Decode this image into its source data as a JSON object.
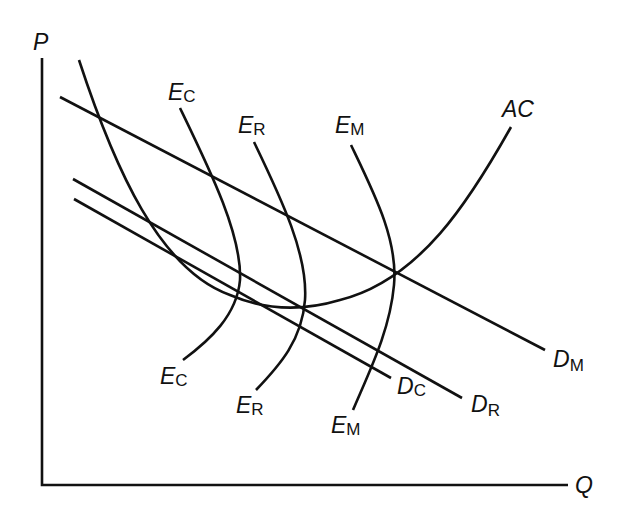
{
  "diagram": {
    "type": "economics-cost-demand-diagram",
    "axes": {
      "y_label": "P",
      "x_label": "Q"
    },
    "curves": {
      "average_cost": {
        "label": "AC"
      },
      "demand_monopoly": {
        "label_main": "D",
        "label_sub": "M"
      },
      "demand_cournot": {
        "label_main": "D",
        "label_sub": "C"
      },
      "demand_r": {
        "label_main": "D",
        "label_sub": "R"
      },
      "equilibrium_cournot": {
        "label_main": "E",
        "label_sub": "C"
      },
      "equilibrium_r": {
        "label_main": "E",
        "label_sub": "R"
      },
      "equilibrium_monopoly": {
        "label_main": "E",
        "label_sub": "M"
      }
    },
    "colors": {
      "line": "#111111",
      "background": "#ffffff"
    }
  }
}
